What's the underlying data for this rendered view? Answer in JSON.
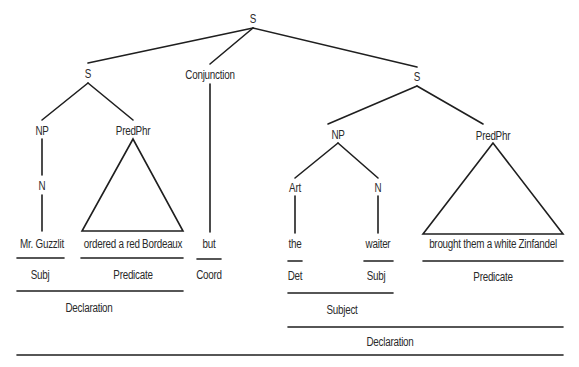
{
  "diagram": {
    "nodes": {
      "root_s": {
        "label": "S",
        "x": 253,
        "y": 19
      },
      "left_s": {
        "label": "S",
        "x": 88,
        "y": 74
      },
      "conjunction": {
        "label": "Conjunction",
        "x": 210,
        "y": 75
      },
      "right_s": {
        "label": "S",
        "x": 417,
        "y": 77
      },
      "left_np": {
        "label": "NP",
        "x": 42,
        "y": 131
      },
      "left_predphr": {
        "label": "PredPhr",
        "x": 133,
        "y": 131
      },
      "left_n": {
        "label": "N",
        "x": 42,
        "y": 186
      },
      "right_np": {
        "label": "NP",
        "x": 338,
        "y": 135
      },
      "right_predphr": {
        "label": "PredPhr",
        "x": 493,
        "y": 136
      },
      "right_art": {
        "label": "Art",
        "x": 295,
        "y": 188
      },
      "right_n": {
        "label": "N",
        "x": 378,
        "y": 188
      }
    },
    "words": [
      {
        "text": "Mr. Guzzlit",
        "x": 42,
        "y": 244
      },
      {
        "text": "ordered a red Bordeaux",
        "x": 133,
        "y": 244
      },
      {
        "text": "but",
        "x": 209,
        "y": 244
      },
      {
        "text": "the",
        "x": 295,
        "y": 244
      },
      {
        "text": "waiter",
        "x": 378,
        "y": 244
      },
      {
        "text": "brought them a white Zinfandel",
        "x": 493,
        "y": 244
      }
    ],
    "functions_level1": [
      {
        "text": "Subj",
        "x": 40,
        "y": 275
      },
      {
        "text": "Predicate",
        "x": 133,
        "y": 275
      },
      {
        "text": "Coord",
        "x": 209,
        "y": 275
      },
      {
        "text": "Det",
        "x": 295,
        "y": 276
      },
      {
        "text": "Subj",
        "x": 376,
        "y": 276
      },
      {
        "text": "Predicate",
        "x": 493,
        "y": 277
      }
    ],
    "functions_level2": [
      {
        "text": "Declaration",
        "x": 89,
        "y": 308
      },
      {
        "text": "Subject",
        "x": 342,
        "y": 310
      }
    ],
    "functions_level3": [
      {
        "text": "Declaration",
        "x": 390,
        "y": 342
      }
    ],
    "colors": {
      "line": "#1f1f1f",
      "text": "#2a2a2a",
      "background": "#ffffff"
    }
  }
}
